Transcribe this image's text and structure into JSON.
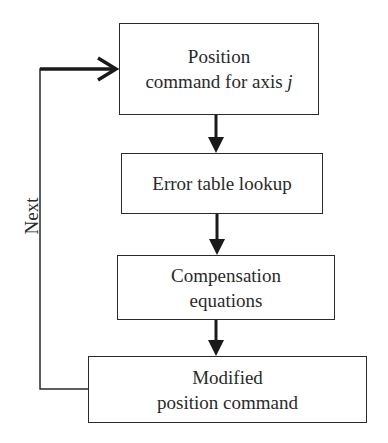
{
  "diagram": {
    "type": "flowchart",
    "nodes": [
      {
        "id": "position-command",
        "line1": "Position",
        "line2": "command for axis",
        "variable": "j"
      },
      {
        "id": "error-table-lookup",
        "line1": "Error table lookup"
      },
      {
        "id": "compensation-equations",
        "line1": "Compensation",
        "line2": "equations"
      },
      {
        "id": "modified-position-command",
        "line1": "Modified",
        "line2": "position command"
      }
    ],
    "edges": [
      {
        "from": "position-command",
        "to": "error-table-lookup"
      },
      {
        "from": "error-table-lookup",
        "to": "compensation-equations"
      },
      {
        "from": "compensation-equations",
        "to": "modified-position-command"
      },
      {
        "from": "modified-position-command",
        "to": "position-command",
        "label": "Next"
      }
    ],
    "loop_label": "Next"
  }
}
